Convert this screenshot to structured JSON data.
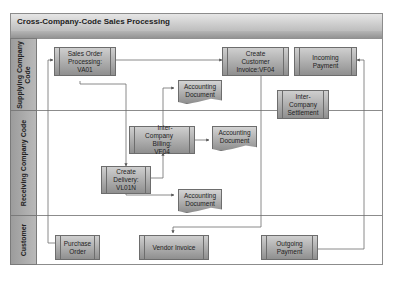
{
  "diagram": {
    "title": "Cross-Company-Code Sales Processing",
    "lanes": [
      {
        "label_line1": "Supplying Company",
        "label_line2": "Code"
      },
      {
        "label": "Receiving Company Code"
      },
      {
        "label": "Customer"
      }
    ],
    "nodes": {
      "sales_order": {
        "line1": "Sales Order",
        "line2": "Processing:",
        "line3": "VA01"
      },
      "create_invoice": {
        "line1": "Create",
        "line2": "Customer",
        "line3": "Invoice:VF04"
      },
      "incoming_payment": {
        "line1": "Incoming",
        "line2": "Payment"
      },
      "acct_doc_1": {
        "line1": "Accounting",
        "line2": "Document"
      },
      "ic_settlement": {
        "line1": "Inter-",
        "line2": "Company",
        "line3": "Settlement"
      },
      "ic_billing": {
        "line1": "Inter-Company",
        "line2": "Billing:",
        "line3": "VF04"
      },
      "acct_doc_2": {
        "line1": "Accounting",
        "line2": "Document"
      },
      "create_delivery": {
        "line1": "Create",
        "line2": "Delivery:",
        "line3": "VL01N"
      },
      "acct_doc_3": {
        "line1": "Accounting",
        "line2": "Document"
      },
      "purchase_order": {
        "line1": "Purchase",
        "line2": "Order"
      },
      "vendor_invoice": {
        "line1": "Vendor Invoice"
      },
      "outgoing_payment": {
        "line1": "Outgoing",
        "line2": "Payment"
      }
    },
    "colors": {
      "box_top": "#cfcfcf",
      "box_bottom": "#8f8f8f",
      "lane_label": "#a8a8a8",
      "line": "#6d6d6d"
    }
  }
}
